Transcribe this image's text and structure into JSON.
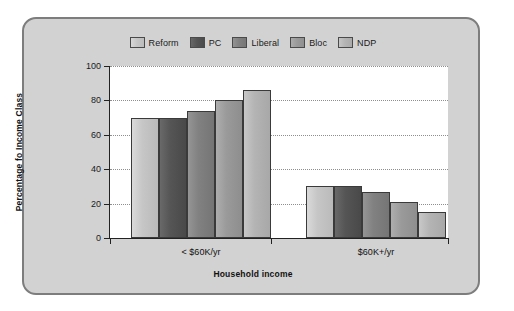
{
  "chart_data": {
    "type": "bar",
    "title": "",
    "xlabel": "Household income",
    "ylabel": "Percentage fo Income Class",
    "categories": [
      "< $60K/yr",
      "$60K+/yr"
    ],
    "series": [
      {
        "name": "Reform",
        "color": "#c6c6c6",
        "values": [
          70,
          30
        ]
      },
      {
        "name": "PC",
        "color": "#555555",
        "values": [
          70,
          30
        ]
      },
      {
        "name": "Liberal",
        "color": "#818181",
        "values": [
          74,
          27
        ]
      },
      {
        "name": "Bloc",
        "color": "#9a9a9a",
        "values": [
          80,
          21
        ]
      },
      {
        "name": "NDP",
        "color": "#b4b4b4",
        "values": [
          86,
          15
        ]
      }
    ],
    "ylim": [
      0,
      100
    ],
    "yticks": [
      0,
      20,
      40,
      60,
      80,
      100
    ],
    "ytick_labels": [
      "0",
      "20",
      "40",
      "60",
      "80",
      "100"
    ],
    "grid": true,
    "grid_style": "dotted-horizontal",
    "legend_position": "top-center",
    "panel_background": "#d2d2d2",
    "plot_background": "#ffffff"
  }
}
